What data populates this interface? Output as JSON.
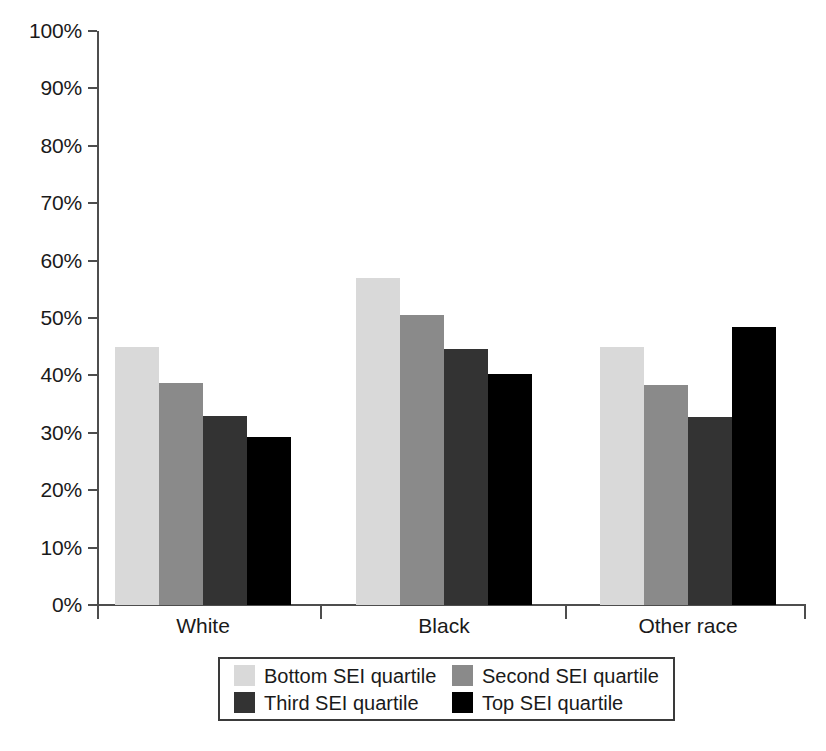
{
  "chart_data": {
    "type": "bar",
    "title": "",
    "subtitle": "",
    "xlabel": "",
    "ylabel": "",
    "categories": [
      "White",
      "Black",
      "Other race"
    ],
    "series": [
      {
        "name": "Bottom SEI quartile",
        "color": "#d9d9d9",
        "values": [
          45.0,
          57.0,
          44.9
        ]
      },
      {
        "name": "Second SEI quartile",
        "color": "#8a8a8a",
        "values": [
          38.6,
          50.5,
          38.4
        ]
      },
      {
        "name": "Third SEI quartile",
        "color": "#333333",
        "values": [
          33.0,
          44.6,
          32.8
        ]
      },
      {
        "name": "Top SEI quartile",
        "color": "#000000",
        "values": [
          29.3,
          40.2,
          48.5
        ]
      }
    ],
    "ylim": [
      0,
      100
    ],
    "yticks": [
      0,
      10,
      20,
      30,
      40,
      50,
      60,
      70,
      80,
      90,
      100
    ],
    "ytick_labels": [
      "0%",
      "10%",
      "20%",
      "30%",
      "40%",
      "50%",
      "60%",
      "70%",
      "80%",
      "90%",
      "100%"
    ],
    "ytick_suffix": "%",
    "grid": false,
    "legend_position": "bottom",
    "legend_entries": [
      "Bottom SEI quartile",
      "Second SEI quartile",
      "Third SEI quartile",
      "Top SEI quartile"
    ],
    "axis_color": "#4d4d4d",
    "background": "#ffffff"
  }
}
